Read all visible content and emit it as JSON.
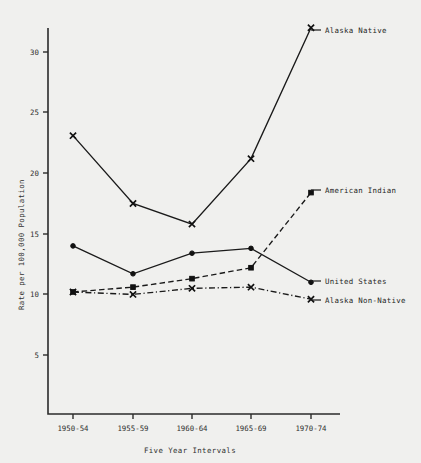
{
  "chart_data": {
    "type": "line",
    "title": "",
    "xlabel": "Five Year Intervals",
    "ylabel": "Rate per 100,000 Population",
    "categories": [
      "1950-54",
      "1955-59",
      "1960-64",
      "1965-69",
      "1970-74"
    ],
    "yticks": [
      5,
      10,
      15,
      20,
      25,
      30
    ],
    "ylim": [
      0,
      33
    ],
    "grid": false,
    "legend_position": "right-inline-labels",
    "series": [
      {
        "name": "Alaska Native",
        "values": [
          23.1,
          17.5,
          15.8,
          21.2,
          32.0
        ],
        "line_style": "solid",
        "marker": "x",
        "color": "#1a1a1a"
      },
      {
        "name": "American Indian",
        "values": [
          10.2,
          10.6,
          11.3,
          12.2,
          18.4
        ],
        "line_style": "dashed",
        "marker": "square",
        "color": "#1a1a1a"
      },
      {
        "name": "United States",
        "values": [
          14.0,
          11.7,
          13.4,
          13.8,
          11.0
        ],
        "line_style": "solid",
        "marker": "dot",
        "color": "#1a1a1a"
      },
      {
        "name": "Alaska Non-Native",
        "values": [
          10.2,
          10.0,
          10.5,
          10.6,
          9.6
        ],
        "line_style": "dashdot",
        "marker": "x",
        "color": "#1a1a1a"
      }
    ]
  },
  "labels": {
    "alaska_native": "Alaska Native",
    "american_indian": "American Indian",
    "united_states": "United States",
    "alaska_non_native": "Alaska Non-Native",
    "y_axis_title": "Rate per 100,000 Population",
    "x_axis_title": "Five Year Intervals",
    "ytick_5": "5",
    "ytick_10": "10",
    "ytick_15": "15",
    "ytick_20": "20",
    "ytick_25": "25",
    "ytick_30": "30",
    "xtick_0": "1950-54",
    "xtick_1": "1955-59",
    "xtick_2": "1960-64",
    "xtick_3": "1965-69",
    "xtick_4": "1970-74"
  }
}
